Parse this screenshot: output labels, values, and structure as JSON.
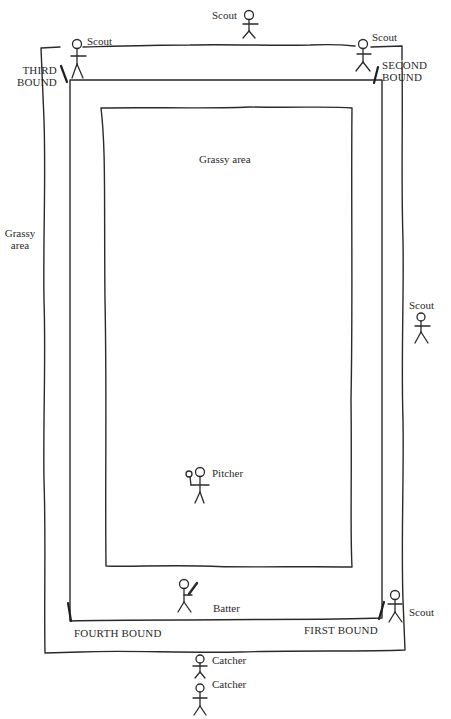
{
  "diagram": {
    "labels": {
      "scout_top_center": "Scout",
      "scout_top_left": "Scout",
      "scout_top_right": "Scout",
      "scout_right": "Scout",
      "scout_bottom_right": "Scout",
      "third_bound_line1": "THIRD",
      "third_bound_line2": "BOUND",
      "second_bound_line1": "SECOND",
      "second_bound_line2": "BOUND",
      "grassy_outer_line1": "Grassy",
      "grassy_outer_line2": "area",
      "grassy_inner": "Grassy area",
      "pitcher": "Pitcher",
      "batter": "Batter",
      "fourth_bound": "FOURTH BOUND",
      "first_bound": "FIRST BOUND",
      "catcher_1": "Catcher",
      "catcher_2": "Catcher"
    },
    "colors": {
      "line": "#2a2a2a",
      "background": "#ffffff"
    }
  }
}
